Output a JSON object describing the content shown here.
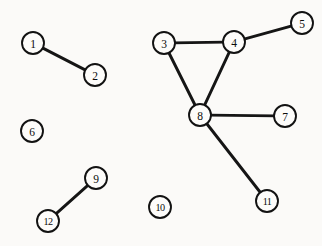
{
  "figure": {
    "background_color": "#fbfaf8",
    "stroke_color": "#151515",
    "node_fill_color": "#fdfcfa",
    "width": 322,
    "height": 246
  },
  "chart_data": {
    "type": "diagram",
    "subtype": "node-link-graph",
    "directed": false,
    "node_count": 12,
    "edge_count": 7,
    "nodes": [
      {
        "id": "1",
        "label": "1",
        "x": 33,
        "y": 43,
        "r": 11,
        "degree": 1
      },
      {
        "id": "2",
        "label": "2",
        "x": 95,
        "y": 75,
        "r": 11,
        "degree": 1
      },
      {
        "id": "3",
        "label": "3",
        "x": 164,
        "y": 43,
        "r": 11,
        "degree": 2
      },
      {
        "id": "4",
        "label": "4",
        "x": 234,
        "y": 42,
        "r": 11,
        "degree": 3
      },
      {
        "id": "5",
        "label": "5",
        "x": 302,
        "y": 23,
        "r": 11,
        "degree": 1
      },
      {
        "id": "6",
        "label": "6",
        "x": 32,
        "y": 131,
        "r": 11,
        "degree": 0
      },
      {
        "id": "7",
        "label": "7",
        "x": 285,
        "y": 116,
        "r": 11,
        "degree": 1
      },
      {
        "id": "8",
        "label": "8",
        "x": 200,
        "y": 115,
        "r": 11,
        "degree": 4
      },
      {
        "id": "9",
        "label": "9",
        "x": 96,
        "y": 178,
        "r": 11,
        "degree": 1
      },
      {
        "id": "10",
        "label": "10",
        "x": 160,
        "y": 207,
        "r": 11,
        "degree": 0
      },
      {
        "id": "11",
        "label": "11",
        "x": 267,
        "y": 201,
        "r": 11,
        "degree": 1
      },
      {
        "id": "12",
        "label": "12",
        "x": 48,
        "y": 221,
        "r": 11,
        "degree": 1
      }
    ],
    "edges": [
      {
        "source": "1",
        "target": "2"
      },
      {
        "source": "3",
        "target": "4"
      },
      {
        "source": "4",
        "target": "5"
      },
      {
        "source": "3",
        "target": "8"
      },
      {
        "source": "4",
        "target": "8"
      },
      {
        "source": "7",
        "target": "8"
      },
      {
        "source": "8",
        "target": "11"
      },
      {
        "source": "9",
        "target": "12"
      }
    ],
    "isolated_nodes": [
      "6",
      "10"
    ],
    "components": [
      [
        "1",
        "2"
      ],
      [
        "3",
        "4",
        "5",
        "7",
        "8",
        "11"
      ],
      [
        "6"
      ],
      [
        "9",
        "12"
      ],
      [
        "10"
      ]
    ]
  }
}
